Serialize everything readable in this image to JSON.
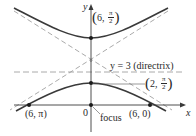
{
  "diagram": {
    "type": "conic-polar-hyperbola",
    "axes": {
      "x_label": "x",
      "y_label": "y",
      "origin_label": "0"
    },
    "directrix": {
      "label": "y = 3 (directrix)"
    },
    "focus": {
      "label": "focus"
    },
    "points": [
      {
        "id": "upper-vertex",
        "label_r": "6",
        "label_theta_num": "π",
        "label_theta_den": "2"
      },
      {
        "id": "lower-vertex",
        "label_r": "2",
        "label_theta_num": "π",
        "label_theta_den": "2"
      },
      {
        "id": "left-x-intercept",
        "label": "(6, π)"
      },
      {
        "id": "right-x-intercept",
        "label": "(6, 0)"
      }
    ],
    "colors": {
      "curve": "#3a3a3a",
      "axes": "#3a3a3a",
      "dashed": "#9a9a9a",
      "text": "#2a2a2a"
    }
  }
}
